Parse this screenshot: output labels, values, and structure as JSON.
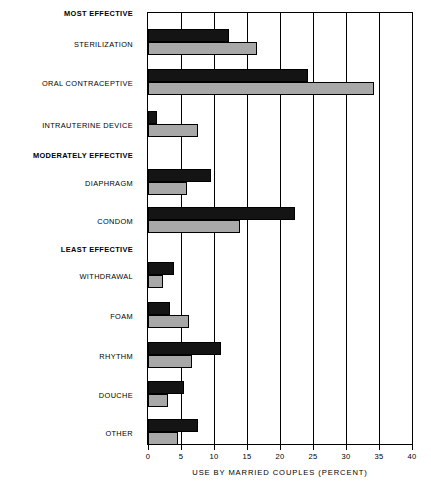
{
  "chart_data": {
    "type": "bar",
    "orientation": "horizontal",
    "title": "",
    "xlabel": "USE BY MARRIED COUPLES (PERCENT)",
    "ylabel": "",
    "xlim": [
      0,
      40
    ],
    "xticks": [
      0,
      5,
      10,
      15,
      20,
      25,
      30,
      35,
      40
    ],
    "xtick_labels": [
      "0",
      "5",
      "10",
      "15",
      "20",
      "25",
      "30",
      "35",
      "40"
    ],
    "grid": true,
    "grid_axis": "x",
    "legend": "none",
    "series": [
      {
        "name": "dark",
        "color": "#141414",
        "values": [
          12.3,
          24.2,
          1.3,
          9.5,
          22.2,
          4.0,
          3.4,
          11.0,
          5.4,
          7.6
        ]
      },
      {
        "name": "light",
        "color": "#a8a8a8",
        "values": [
          16.5,
          34.3,
          7.5,
          5.9,
          14.0,
          2.3,
          6.2,
          6.6,
          3.1,
          4.5
        ]
      }
    ],
    "categories": [
      "STERILIZATION",
      "ORAL CONTRACEPTIVE",
      "INTRAUTERINE DEVICE",
      "DIAPHRAGM",
      "CONDOM",
      "WITHDRAWAL",
      "FOAM",
      "RHYTHM",
      "DOUCHE",
      "OTHER"
    ],
    "group_headings": [
      "MOST EFFECTIVE",
      "MODERATELY EFFECTIVE",
      "LEAST EFFECTIVE"
    ]
  },
  "rows": [
    {
      "label": "MOST EFFECTIVE",
      "kind": "group",
      "y": 14,
      "bar_top": null
    },
    {
      "label": "STERILIZATION",
      "kind": "category",
      "y": 45,
      "bar_top": 16,
      "dark": 12.3,
      "light": 16.5
    },
    {
      "label": "ORAL CONTRACEPTIVE",
      "kind": "category",
      "y": 84,
      "bar_top": 56,
      "dark": 24.2,
      "light": 34.3
    },
    {
      "label": "INTRAUTERINE DEVICE",
      "kind": "category",
      "y": 126,
      "bar_top": 98,
      "dark": 1.3,
      "light": 7.5
    },
    {
      "label": "MODERATELY EFFECTIVE",
      "kind": "group",
      "y": 156,
      "bar_top": null
    },
    {
      "label": "DIAPHRAGM",
      "kind": "category",
      "y": 184,
      "bar_top": 156,
      "dark": 9.5,
      "light": 5.9
    },
    {
      "label": "CONDOM",
      "kind": "category",
      "y": 222,
      "bar_top": 194,
      "dark": 22.2,
      "light": 14.0
    },
    {
      "label": "LEAST EFFECTIVE",
      "kind": "group",
      "y": 250,
      "bar_top": null
    },
    {
      "label": "WITHDRAWAL",
      "kind": "category",
      "y": 277,
      "bar_top": 249,
      "dark": 4.0,
      "light": 2.3
    },
    {
      "label": "FOAM",
      "kind": "category",
      "y": 317,
      "bar_top": 289,
      "dark": 3.4,
      "light": 6.2
    },
    {
      "label": "RHYTHM",
      "kind": "category",
      "y": 357,
      "bar_top": 329,
      "dark": 11.0,
      "light": 6.6
    },
    {
      "label": "DOUCHE",
      "kind": "category",
      "y": 396,
      "bar_top": 368,
      "dark": 5.4,
      "light": 3.1
    },
    {
      "label": "OTHER",
      "kind": "category",
      "y": 434,
      "bar_top": 406,
      "dark": 7.6,
      "light": 4.5
    }
  ],
  "axis": {
    "title": "USE BY MARRIED COUPLES (PERCENT)",
    "ticks": [
      "0",
      "5",
      "10",
      "15",
      "20",
      "25",
      "30",
      "35",
      "40"
    ],
    "min": 0,
    "max": 40
  },
  "colors": {
    "dark_series": "#141414",
    "light_series": "#a8a8a8",
    "axis": "#000000",
    "background": "#ffffff"
  }
}
